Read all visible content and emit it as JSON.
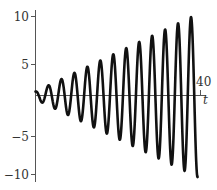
{
  "chart_data": {
    "type": "line",
    "title": "",
    "xlabel": "t",
    "ylabel": "",
    "xlim": [
      0,
      40
    ],
    "ylim": [
      -10,
      10
    ],
    "grid": false,
    "legend": null,
    "x_ticks": [
      {
        "value": 40,
        "label": "40"
      }
    ],
    "y_ticks": [
      {
        "value": 10,
        "label": "10"
      },
      {
        "value": 5,
        "label": "5"
      },
      {
        "value": -5,
        "label": "−5"
      },
      {
        "value": -10,
        "label": "−10"
      }
    ],
    "series": [
      {
        "name": "y(t)",
        "description": "oscillation with linearly growing amplitude (resonance), approx y = (0.5 + t/4)·cos(2t)",
        "t_range": [
          0,
          39.3
        ],
        "amplitude_offset": 0.5,
        "amplitude_slope": 0.25,
        "angular_frequency": 2,
        "peaks": [
          {
            "t": 3.14,
            "y": 1.3
          },
          {
            "t": 6.28,
            "y": 2.1
          },
          {
            "t": 9.42,
            "y": 2.9
          },
          {
            "t": 12.57,
            "y": 3.6
          },
          {
            "t": 15.71,
            "y": 4.4
          },
          {
            "t": 18.85,
            "y": 5.2
          },
          {
            "t": 21.99,
            "y": 6.0
          },
          {
            "t": 25.13,
            "y": 6.8
          },
          {
            "t": 28.27,
            "y": 7.6
          },
          {
            "t": 31.42,
            "y": 8.4
          },
          {
            "t": 34.56,
            "y": 9.1
          },
          {
            "t": 37.7,
            "y": 9.9
          }
        ],
        "troughs": [
          {
            "t": 1.57,
            "y": -0.9
          },
          {
            "t": 4.71,
            "y": -1.7
          },
          {
            "t": 7.85,
            "y": -2.5
          },
          {
            "t": 11.0,
            "y": -3.2
          },
          {
            "t": 14.14,
            "y": -4.0
          },
          {
            "t": 17.28,
            "y": -4.8
          },
          {
            "t": 20.42,
            "y": -5.6
          },
          {
            "t": 23.56,
            "y": -6.4
          },
          {
            "t": 26.7,
            "y": -7.2
          },
          {
            "t": 29.85,
            "y": -8.0
          },
          {
            "t": 32.99,
            "y": -8.7
          },
          {
            "t": 36.13,
            "y": -9.5
          },
          {
            "t": 39.27,
            "y": -10.3
          }
        ],
        "color": "#111111"
      }
    ]
  },
  "labels": {
    "x_axis": "t",
    "x_tick_40": "40",
    "y_tick_10": "10",
    "y_tick_5": "5",
    "y_tick_m5": "−5",
    "y_tick_m10": "−10"
  }
}
